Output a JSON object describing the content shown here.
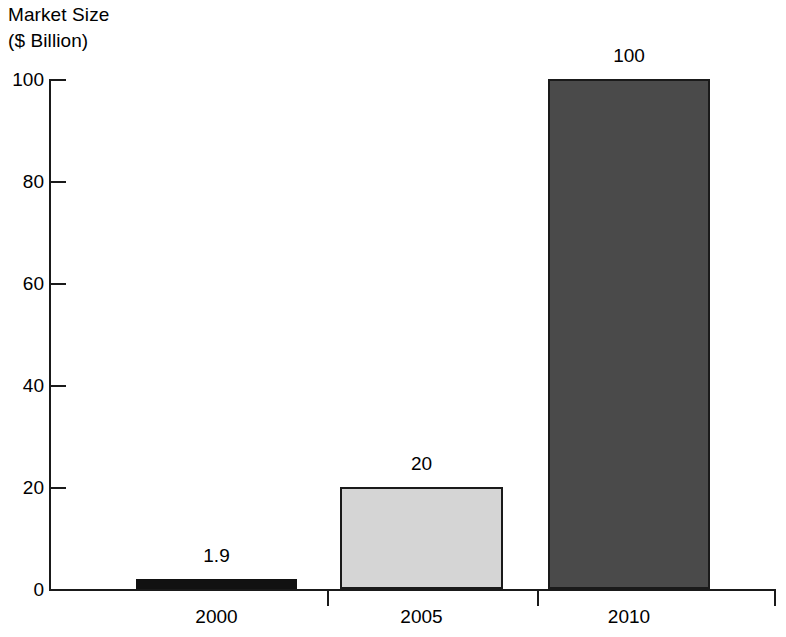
{
  "chart_data": {
    "type": "bar",
    "title": "",
    "ylabel": "Market Size ($ Billion)",
    "ylabel_line1": "Market Size",
    "ylabel_line2": "($ Billion)",
    "xlabel": "",
    "categories": [
      "2000",
      "2005",
      "2010"
    ],
    "values": [
      1.9,
      20,
      100
    ],
    "value_labels": [
      "1.9",
      "20",
      "100"
    ],
    "series": [
      {
        "name": "Market Size",
        "values": [
          1.9,
          20,
          100
        ]
      }
    ],
    "ylim": [
      0,
      100
    ],
    "yticks": [
      0,
      20,
      40,
      60,
      80,
      100
    ],
    "ytick_labels": [
      "0",
      "20",
      "40",
      "60",
      "80",
      "100"
    ],
    "grid": false,
    "legend": "none",
    "bar_colors": [
      "#111111",
      "#d5d5d5",
      "#4a4a4a"
    ],
    "bar_border_color": "#1a1a1a",
    "axis_color": "#1a1a1a",
    "background": "#ffffff"
  },
  "axis": {
    "y_title_line1": "Market Size",
    "y_title_line2": "($ Billion)",
    "ticks": [
      {
        "label": "100",
        "value": 100
      },
      {
        "label": "80",
        "value": 80
      },
      {
        "label": "60",
        "value": 60
      },
      {
        "label": "40",
        "value": 40
      },
      {
        "label": "20",
        "value": 20
      },
      {
        "label": "0",
        "value": 0
      }
    ]
  },
  "bars": [
    {
      "category": "2000",
      "value_label": "1.9",
      "value": 1.9,
      "fill": "#111111"
    },
    {
      "category": "2005",
      "value_label": "20",
      "value": 20,
      "fill": "#d5d5d5"
    },
    {
      "category": "2010",
      "value_label": "100",
      "value": 100,
      "fill": "#4a4a4a"
    }
  ]
}
